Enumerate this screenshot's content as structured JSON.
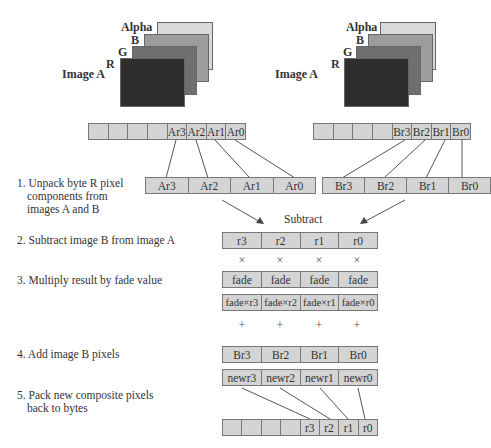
{
  "images": [
    {
      "label": "Image A",
      "channels": [
        "Alpha",
        "B",
        "G",
        "R"
      ]
    },
    {
      "label": "Image A",
      "channels": [
        "Alpha",
        "B",
        "G",
        "R"
      ]
    }
  ],
  "colors": {
    "alpha": "#d9d9d9",
    "b": "#9c9c9c",
    "g": "#6f6f6f",
    "r": "#2e2e2e",
    "cell": "#d4d4d4"
  },
  "byte_rows": {
    "a": [
      "",
      "",
      "",
      "",
      "Ar3",
      "Ar2",
      "Ar1",
      "Ar0"
    ],
    "b": [
      "",
      "",
      "",
      "",
      "Br3",
      "Br2",
      "Br1",
      "Br0"
    ],
    "out": [
      "",
      "",
      "",
      "",
      "r3",
      "r2",
      "r1",
      "r0"
    ]
  },
  "unpacked": {
    "a": [
      "Ar3",
      "Ar2",
      "Ar1",
      "Ar0"
    ],
    "b": [
      "Br3",
      "Br2",
      "Br1",
      "Br0"
    ]
  },
  "subtract_label": "Subtract",
  "result_row": [
    "r3",
    "r2",
    "r1",
    "r0"
  ],
  "multiply_symbol": "×",
  "fade_row": [
    "fade",
    "fade",
    "fade",
    "fade"
  ],
  "product_row": [
    "fade×r3",
    "fade×r2",
    "fade×r1",
    "fade×r0"
  ],
  "add_symbol": "+",
  "b_pixels_row": [
    "Br3",
    "Br2",
    "Br1",
    "Br0"
  ],
  "new_row": [
    "newr3",
    "newr2",
    "newr1",
    "newr0"
  ],
  "steps": [
    {
      "line1": "1. Unpack byte R pixel",
      "line2": "components from",
      "line3": "images A and B"
    },
    {
      "line1": "2. Subtract image B from image A"
    },
    {
      "line1": "3. Multiply result by fade value"
    },
    {
      "line1": "4. Add image B pixels"
    },
    {
      "line1": "5. Pack new composite pixels",
      "line2": "back to bytes"
    }
  ]
}
